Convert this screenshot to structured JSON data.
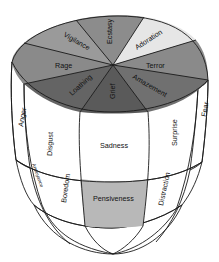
{
  "diagram": {
    "title": "",
    "type": "3D emotion solid (cone/cylinder cross-section)",
    "top_face": {
      "segments": [
        {
          "label": "Ecstasy",
          "color": "#8c8c8c"
        },
        {
          "label": "Adoration",
          "color": "#e6e6e6"
        },
        {
          "label": "Terror",
          "color": "#8a8a8a"
        },
        {
          "label": "Amazement",
          "color": "#707070"
        },
        {
          "label": "Grief",
          "color": "#5a5a5a"
        },
        {
          "label": "Loathing",
          "color": "#646464"
        },
        {
          "label": "Rage",
          "color": "#8a8a8a"
        },
        {
          "label": "Vigilance",
          "color": "#9a9a9a"
        }
      ]
    },
    "side_upper_band": {
      "labels": [
        {
          "label": "Anger",
          "color": "#9a9a9a"
        },
        {
          "label": "Disgust",
          "color": "#8c8c8c"
        },
        {
          "label": "Sadness",
          "color": "#8a8a8a"
        },
        {
          "label": "Surprise",
          "color": "#8c8c8c"
        },
        {
          "label": "Fear",
          "color": "#b4b4b4"
        }
      ]
    },
    "side_middle_band": {
      "labels": [
        {
          "label": "Annoyance",
          "color": "#b0b0b0"
        },
        {
          "label": "Boredom",
          "color": "#a0a0a0"
        },
        {
          "label": "Pensiveness",
          "color": "#b8b8b8"
        },
        {
          "label": "Distraction",
          "color": "#a8a8a8"
        }
      ]
    },
    "side_lower_band": {
      "color": "#d2d2d2"
    },
    "colors": {
      "outline": "#1a1a1a",
      "background": "#ffffff"
    }
  }
}
